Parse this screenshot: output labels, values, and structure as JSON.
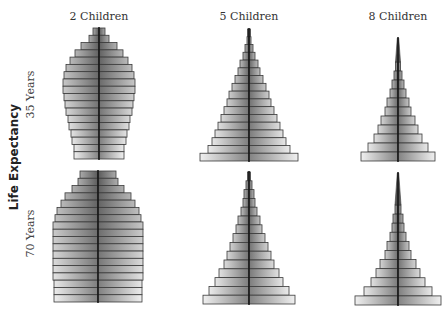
{
  "chart_data": {
    "type": "bar",
    "subtype": "population-pyramid-grid",
    "column_titles": [
      "2 Children",
      "5 Children",
      "8 Children"
    ],
    "row_axis_title": "Life Expectancy",
    "row_titles": [
      "35 Years",
      "70 Years"
    ],
    "note": "Values are relative half-widths of age-group bars, youngest (bottom) to oldest (top) is reversed here: arrays listed top (oldest) to bottom (youngest).",
    "panels": [
      {
        "id": "c2_e35",
        "children": "2 Children",
        "life_expectancy": "35 Years",
        "cx": 99,
        "top": 28,
        "bottom": 159,
        "half_widths": [
          6,
          10,
          18,
          24,
          29,
          33,
          35,
          36,
          36,
          35,
          34,
          33,
          31,
          30,
          28,
          27,
          25,
          25
        ]
      },
      {
        "id": "c5_e35",
        "children": "5 Children",
        "life_expectancy": "35 Years",
        "cx": 249,
        "top": 29,
        "bottom": 161,
        "half_widths": [
          1.5,
          2,
          4,
          6,
          9,
          11,
          14,
          17,
          20,
          22,
          25,
          28,
          31,
          34,
          37,
          41,
          49
        ]
      },
      {
        "id": "c8_e35",
        "children": "8 Children",
        "life_expectancy": "35 Years",
        "cx": 398,
        "top": 38,
        "bottom": 161,
        "spike_top": 38,
        "spike_bottom": 62,
        "half_widths": [
          2.5,
          4,
          6,
          8,
          11,
          13,
          17,
          20,
          24,
          30,
          37
        ]
      },
      {
        "id": "c2_e70",
        "children": "2 Children",
        "life_expectancy": "70 Years",
        "cx": 98,
        "top": 171,
        "bottom": 302,
        "half_widths": [
          18,
          20,
          26,
          33,
          37,
          41,
          43,
          45,
          45,
          45,
          45,
          45,
          45,
          45,
          45,
          44,
          44,
          44
        ]
      },
      {
        "id": "c5_e70",
        "children": "5 Children",
        "life_expectancy": "70 Years",
        "cx": 249,
        "top": 172,
        "bottom": 304,
        "half_widths": [
          1.5,
          3,
          5,
          6,
          8,
          11,
          13,
          16,
          19,
          22,
          25,
          30,
          34,
          40,
          46
        ]
      },
      {
        "id": "c8_e70",
        "children": "8 Children",
        "life_expectancy": "70 Years",
        "cx": 398,
        "top": 173,
        "bottom": 305,
        "spike_top": 173,
        "spike_bottom": 205,
        "half_widths": [
          3,
          5,
          6,
          8,
          11,
          13,
          18,
          22,
          27,
          34,
          43
        ]
      }
    ],
    "colors": {
      "bar_dark": "#6a6a6a",
      "bar_light": "#e6e6e6",
      "outline": "#3a3a3a",
      "axis": "#111111"
    },
    "grid": false,
    "legend": "none"
  },
  "labels": {
    "col1": "2 Children",
    "col2": "5 Children",
    "col3": "8 Children",
    "row_axis": "Life Expectancy",
    "row1": "35 Years",
    "row2": "70 Years"
  }
}
